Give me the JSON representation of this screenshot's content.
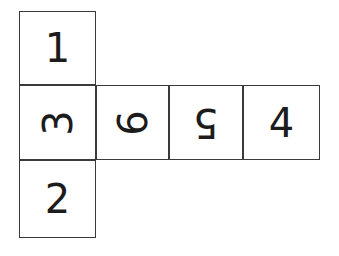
{
  "diagram": {
    "type": "cube-net",
    "background_color": "#ffffff",
    "stroke_color": "#3a3a3a",
    "glyph_color": "#1c1c1c",
    "cell_size": 77,
    "cells": [
      {
        "id": "top",
        "value": "1",
        "rotation": 0,
        "x": 19,
        "y": 11,
        "w": 77,
        "h": 74
      },
      {
        "id": "middle-left",
        "value": "3",
        "rotation": 90,
        "x": 19,
        "y": 85,
        "w": 77,
        "h": 75
      },
      {
        "id": "middle-second",
        "value": "6",
        "rotation": 90,
        "x": 96,
        "y": 85,
        "w": 73,
        "h": 75
      },
      {
        "id": "middle-third",
        "value": "5",
        "rotation": 180,
        "x": 169,
        "y": 85,
        "w": 74,
        "h": 75
      },
      {
        "id": "middle-right",
        "value": "4",
        "rotation": 0,
        "x": 243,
        "y": 85,
        "w": 77,
        "h": 75
      },
      {
        "id": "bottom",
        "value": "2",
        "rotation": 0,
        "x": 19,
        "y": 160,
        "w": 77,
        "h": 78
      }
    ]
  }
}
